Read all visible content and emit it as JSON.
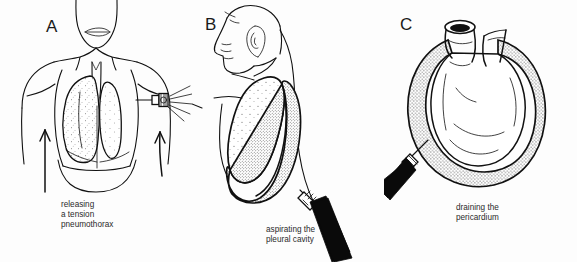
{
  "figure": {
    "background_color": "#fdfdfd",
    "ink_color": "#111111",
    "stipple_color": "#3a3a3a",
    "panel_count": 3
  },
  "panels": [
    {
      "id": "A",
      "label": "A",
      "caption_lines": [
        "releasing",
        "a tension",
        "pneumothorax"
      ],
      "caption_text": "releasing\na tension\npneumothorax",
      "view": "anterior chest, frontal",
      "elements": [
        "head-and-neck-frontal",
        "shoulders-and-chest-outline",
        "trachea",
        "right-lung-stippled",
        "collapsed-left-lung-stippled",
        "diaphragm",
        "cannula-with-escaping-air",
        "air-escape-lines",
        "left-upward-arrow",
        "right-upward-arrow"
      ]
    },
    {
      "id": "B",
      "label": "B",
      "caption_lines": [
        "aspirating the",
        "pleural cavity"
      ],
      "caption_text": "aspirating the\npleural cavity",
      "view": "lateral chest, profile",
      "elements": [
        "head-profile-facing-left",
        "ear",
        "neck-and-back-outline",
        "shoulder-and-arm-outline",
        "lung-stippled-light",
        "pleural-effusion-dense-stipple",
        "syringe-black-barrel",
        "needle-hub-striped"
      ]
    },
    {
      "id": "C",
      "label": "C",
      "caption_lines": [
        "draining the",
        "pericardium"
      ],
      "caption_text": "draining the\npericardium",
      "view": "heart with pericardial effusion",
      "elements": [
        "aorta-cut-lumen",
        "pulmonary-artery-stub",
        "heart-body",
        "pericardial-effusion-stippled-band",
        "needle-shaft",
        "needle-hub-striped",
        "syringe-black-barrel"
      ]
    }
  ]
}
